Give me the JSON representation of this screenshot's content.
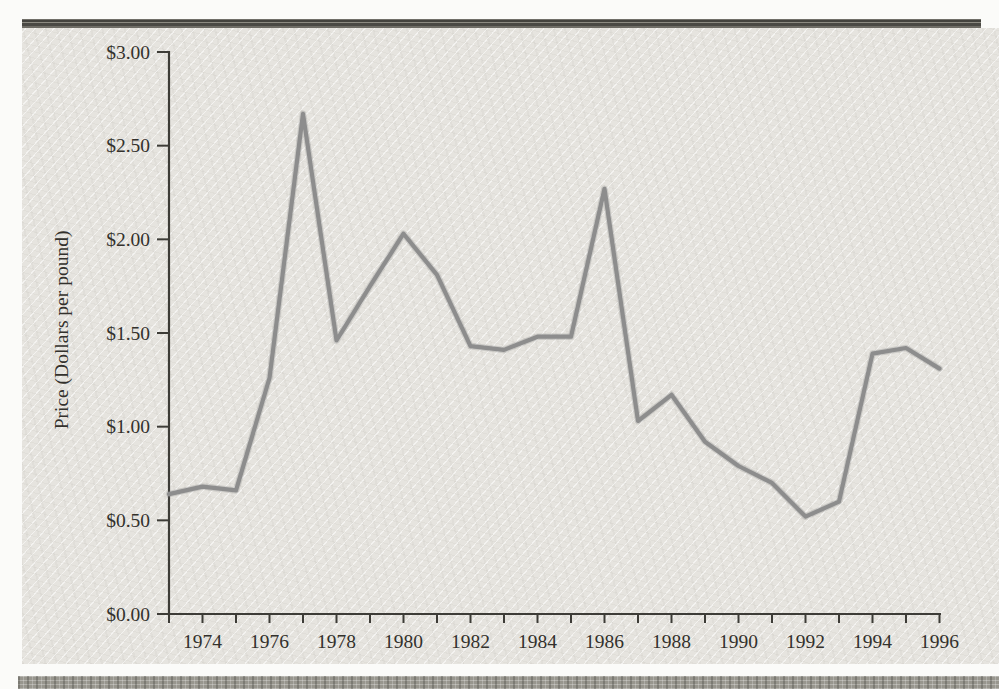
{
  "page": {
    "top_rule_color": "#4a4944",
    "bottom_strip_color": "#98968e",
    "panel_bg": "#e6e4df"
  },
  "chart_data": {
    "type": "line",
    "title": "",
    "xlabel": "",
    "ylabel": "Price (Dollars per pound)",
    "x": [
      1973,
      1974,
      1975,
      1976,
      1977,
      1978,
      1979,
      1980,
      1981,
      1982,
      1983,
      1984,
      1985,
      1986,
      1987,
      1988,
      1989,
      1990,
      1991,
      1992,
      1993,
      1994,
      1995,
      1996
    ],
    "values": [
      0.64,
      0.68,
      0.66,
      1.26,
      2.67,
      1.46,
      1.75,
      2.03,
      1.81,
      1.43,
      1.41,
      1.48,
      1.48,
      2.27,
      1.03,
      1.17,
      0.92,
      0.79,
      0.7,
      0.52,
      0.6,
      1.39,
      1.42,
      1.31
    ],
    "series_name": "Price",
    "xlim": [
      1973,
      1996
    ],
    "ylim": [
      0,
      3
    ],
    "y_ticks": [
      0,
      0.5,
      1,
      1.5,
      2,
      2.5,
      3
    ],
    "y_tick_labels": [
      "$0.00",
      "$0.50",
      "$1.00",
      "$1.50",
      "$2.00",
      "$2.50",
      "$3.00"
    ],
    "x_tick_years": [
      1973,
      1974,
      1975,
      1976,
      1977,
      1978,
      1979,
      1980,
      1981,
      1982,
      1983,
      1984,
      1985,
      1986,
      1987,
      1988,
      1989,
      1990,
      1991,
      1992,
      1993,
      1994,
      1995,
      1996
    ],
    "x_label_years": [
      1974,
      1976,
      1978,
      1980,
      1982,
      1984,
      1986,
      1988,
      1990,
      1992,
      1994,
      1996
    ],
    "x_tick_labels": [
      "1974",
      "1976",
      "1978",
      "1980",
      "1982",
      "1984",
      "1986",
      "1988",
      "1990",
      "1992",
      "1994",
      "1996"
    ],
    "grid": false,
    "legend": "none",
    "line_color": "#8d8d8d",
    "line_halo_color": "#8d8d8d",
    "axis_color": "#3d3c37",
    "text_color": "#33312c"
  }
}
